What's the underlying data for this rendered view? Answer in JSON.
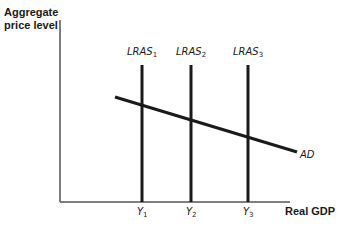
{
  "diagram": {
    "y_axis_title_line1": "Aggregate",
    "y_axis_title_line2": "price level",
    "x_axis_title": "Real GDP",
    "curves": {
      "lras": [
        {
          "label": "LRAS",
          "subscript": "1",
          "x": 142
        },
        {
          "label": "LRAS",
          "subscript": "2",
          "x": 191
        },
        {
          "label": "LRAS",
          "subscript": "3",
          "x": 248
        }
      ],
      "ad": {
        "label": "AD",
        "x1": 115,
        "y1": 97,
        "x2": 297,
        "y2": 152
      }
    },
    "x_ticks": [
      {
        "label": "Y",
        "subscript": "1",
        "x": 142
      },
      {
        "label": "Y",
        "subscript": "2",
        "x": 191
      },
      {
        "label": "Y",
        "subscript": "3",
        "x": 248
      }
    ],
    "colors": {
      "line": "#1a1a1a",
      "axis": "#555555",
      "background": "#ffffff"
    }
  }
}
